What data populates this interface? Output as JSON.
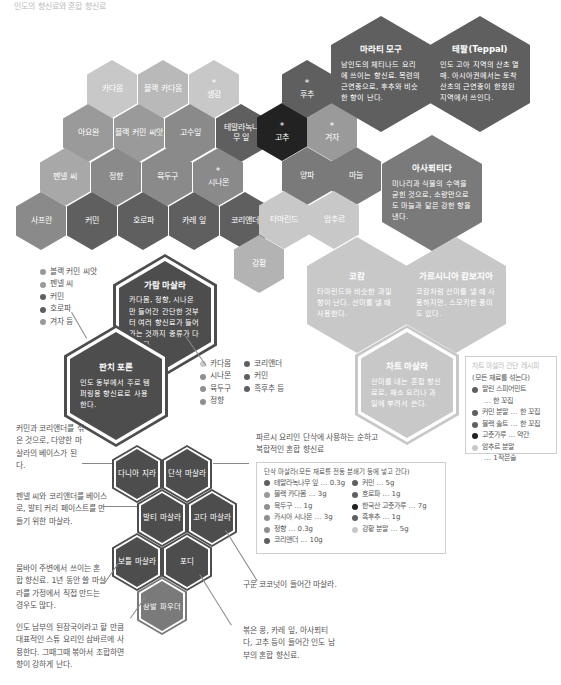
{
  "title": "인도의 향신료와 혼합 향신료",
  "colors": {
    "lightest": "#c8c8c8",
    "light": "#b3b3b3",
    "mid": "#8f8f8f",
    "midDark": "#7a7a7a",
    "dark": "#5f5f5f",
    "darker": "#4d4d4d",
    "black": "#222222"
  },
  "spices": {
    "cardamom": "카다몸",
    "black_cardamom": "블랙 카다몸",
    "ginger": "생강",
    "ajwain": "아요완",
    "black_cumin_seed": "블랙 커민 씨앗",
    "kasuri": "고수잎",
    "tamala_leaf": "테말라녹나무 잎",
    "pepper": "후추",
    "chili": "고추",
    "mustard": "겨자",
    "fennel_seed": "펜넬 씨",
    "clove": "정향",
    "nutmeg": "육두구",
    "cinnamon": "시나몬",
    "onion": "양파",
    "garlic": "마늘",
    "saffron": "사프란",
    "cumin": "커민",
    "fenugreek": "호로파",
    "curry_leaf": "카레 잎",
    "coriander": "코리앤더",
    "tamarind": "타마린드",
    "amchur": "암추르",
    "turmeric": "강황"
  },
  "star": "*",
  "info_hexes": {
    "marathi_moggu": {
      "title": "마라티 모구",
      "desc": "남인도의 체티나드 요리에 쓰이는 향신료. 목련의 근연종으로, 후추와 비슷한 향이 난다."
    },
    "teppal": {
      "title": "테팔(Teppal)",
      "desc": "인도 고아 지역의 산초 열매. 아시아권에서는 토착 산초의 근연종이 한정된 지역에서 쓰인다."
    },
    "asafoetida": {
      "title": "아사푀티다",
      "desc": "미나리과 식물의 수액을 굳힌 것으로, 소량만으로도 마늘과 닮은 강한 향을 낸다."
    },
    "kokum": {
      "title": "코캄",
      "desc": "타마린드와 비슷한 과일 향이 난다. 산미를 낼 때 사용한다."
    },
    "garcinia": {
      "title": "가르시니아 캄보지아",
      "desc": "코캄처럼 산미를 낼 때 사용하지만, 스모키한 풍미도 있다."
    },
    "chaat_masala": {
      "title": "차트 마살라",
      "desc": "산미를 내는 혼합 향신료로, 채소 요리나 과일에 뿌려서 쓴다."
    },
    "garam_masala": {
      "title": "가람 마살라",
      "desc": "카다몸, 정향, 시나몬만 들어간 간단한 것부터 여러 향신료가 들어가는 것까지 종류가 다양하다."
    },
    "panch_phoron": {
      "title": "판치 포론",
      "desc": "인도 동부에서 주로 템퍼링용 향신료로 사용한다."
    }
  },
  "masala_hexes": {
    "dhaniya_jeera": "다니아 지라",
    "dhansak_masala": "단삭 마살라",
    "balti_masala": "발티 마살라",
    "goda_masala": "고다 마살라",
    "bottle_masala": "보틀 마살라",
    "podi": "포디",
    "sambar_powder": "삼발 파우더"
  },
  "panch_phoron_list": [
    {
      "label": "블랙 커민 씨앗",
      "color": "#9a9a9a"
    },
    {
      "label": "펜넬 씨",
      "color": "#9a9a9a"
    },
    {
      "label": "커민",
      "color": "#5f5f5f"
    },
    {
      "label": "호로파",
      "color": "#5f5f5f"
    },
    {
      "label": "겨자 등",
      "color": "#9a9a9a"
    }
  ],
  "garam_masala_list": {
    "col1": [
      {
        "label": "카다몸",
        "color": "#c8c8c8"
      },
      {
        "label": "시나몬",
        "color": "#8f8f8f"
      },
      {
        "label": "육두구",
        "color": "#8f8f8f"
      },
      {
        "label": "정향",
        "color": "#8f8f8f"
      }
    ],
    "col2": [
      {
        "label": "코리앤더",
        "color": "#5f5f5f"
      },
      {
        "label": "커민",
        "color": "#5f5f5f"
      },
      {
        "label": "흑후추 등",
        "color": "#5f5f5f"
      }
    ]
  },
  "chaat_recipe": {
    "header": "차트 마살라 간단 레시피",
    "subheader": "(모든 재료를 섞는다)",
    "items": [
      {
        "label": "말린 스피어민트",
        "cont": "… 한 꼬집",
        "color": "#5f5f5f"
      },
      {
        "label": "커민 분말 … 한 꼬집",
        "color": "#5f5f5f"
      },
      {
        "label": "블랙 솔트 … 한 꼬집",
        "color": "#5f5f5f"
      },
      {
        "label": "고춧가루 … 약간",
        "color": "#222222"
      },
      {
        "label": "암추르 분말",
        "cont": "… 1작은술",
        "color": "#c8c8c8"
      }
    ]
  },
  "dhansak_recipe": {
    "header": "단삭 마살라(모든 재료를 전동 분쇄기 등에 넣고 간다)",
    "col1": [
      {
        "label": "테말라녹나무 잎 … 0.3g",
        "color": "#5f5f5f"
      },
      {
        "label": "블랙 카다몸 … 3g",
        "color": "#9a9a9a"
      },
      {
        "label": "육두구 … 1g",
        "color": "#8f8f8f"
      },
      {
        "label": "카시아 시나몬 … 3g",
        "color": "#8f8f8f"
      },
      {
        "label": "정향 … 0.3g",
        "color": "#8f8f8f"
      },
      {
        "label": "코리앤더 … 10g",
        "color": "#5f5f5f"
      }
    ],
    "col2": [
      {
        "label": "커민 … 5g",
        "color": "#5f5f5f"
      },
      {
        "label": "호로파 … 1g",
        "color": "#5f5f5f"
      },
      {
        "label": "한국산 고춧가루 … 7g",
        "color": "#222222"
      },
      {
        "label": "흑후추 … 1g",
        "color": "#5f5f5f"
      },
      {
        "label": "강황 분말 … 5g",
        "color": "#c8c8c8"
      }
    ]
  },
  "notes": {
    "dhaniya_jeera": "커민과 코리앤더를 섞은 것으로, 다양한 마살라의 베이스가 된다.",
    "dhansak": "파르시 요리인 단삭에 사용하는 순하고 복합적인 혼합 향신료",
    "balti": "펜넬 씨와 코리앤더를 베이스로, 발티 커리 페이스트를 만들기 위한 마살라.",
    "bottle": "뭄바이 주변에서 쓰이는 혼합 향신료. 1년 동안 쓸 마살라를 가정에서 직접 만드는 경우도 많다.",
    "goda": "구운 코코넛이 들어간 마살라.",
    "sambar": "인도 남부의 된장국이라고 할 만큼 대표적인 스튜 요리인 삼바르에 사용한다. 그때그때 볶아서 조합하면 향이 강하게 난다.",
    "podi": "볶은 콩, 카레 잎, 아사푀티다, 고추 등이 들어간 인도 남부의 혼합 향신료."
  }
}
